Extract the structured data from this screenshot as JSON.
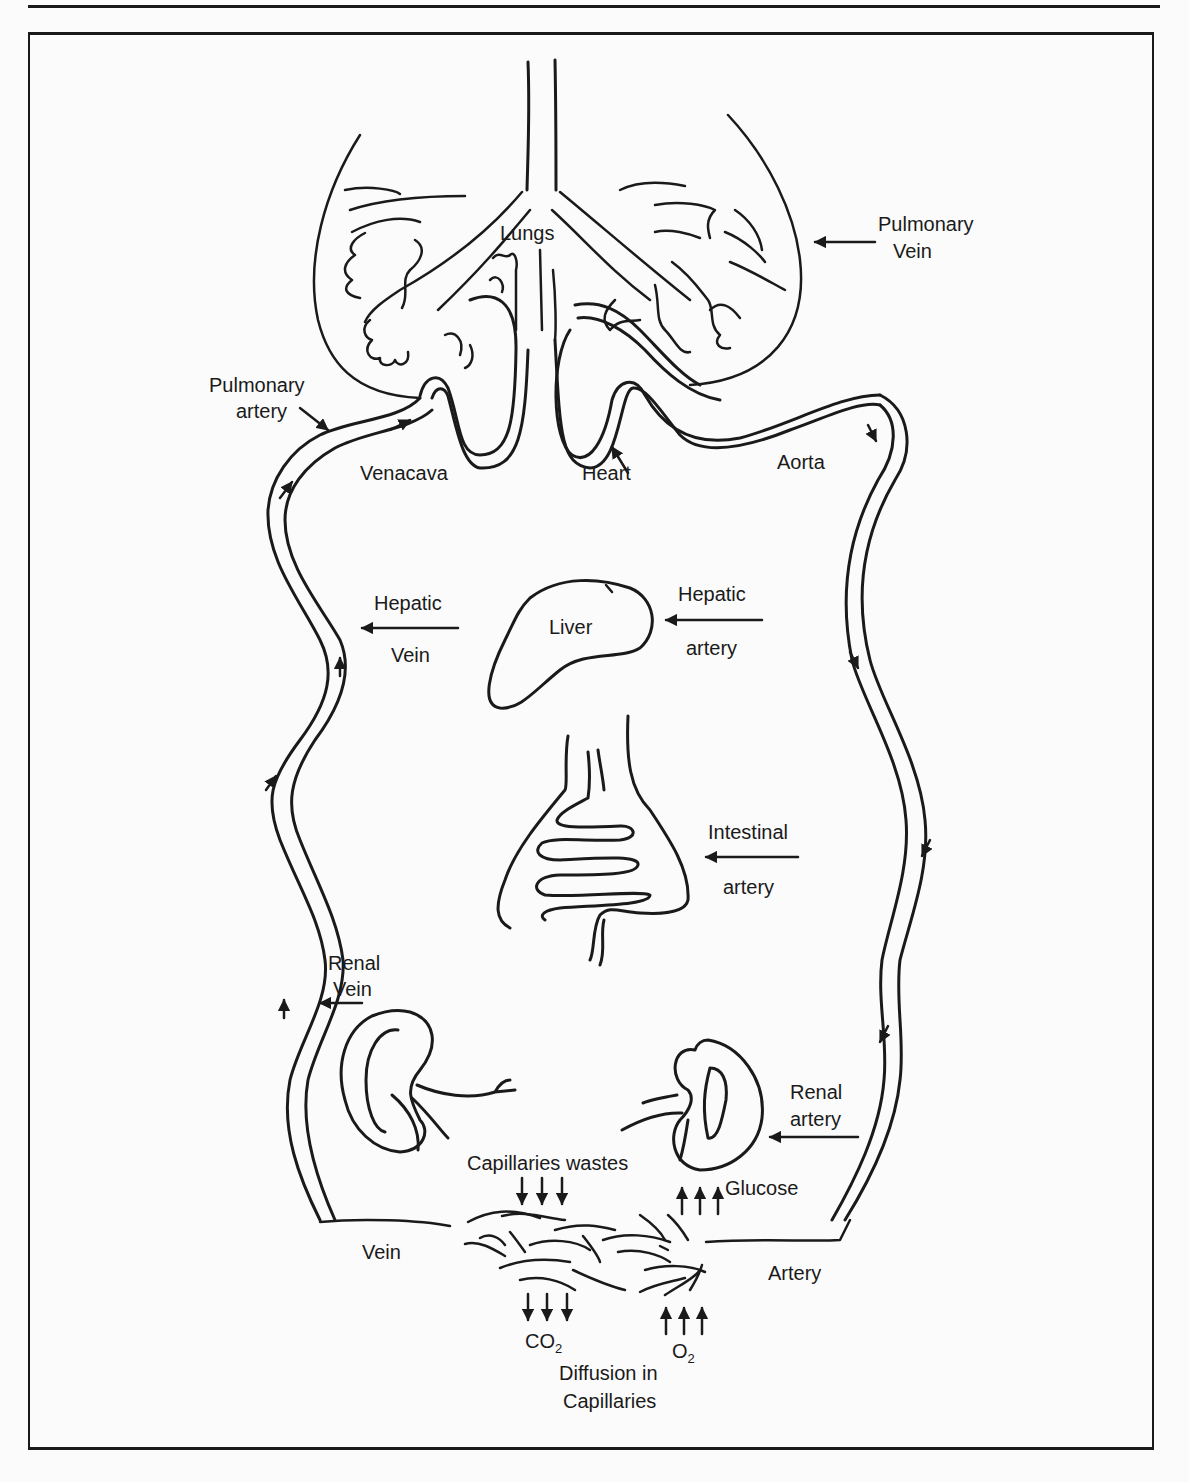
{
  "figure": {
    "colors": {
      "ink": "#1a1a1a",
      "background": "#fbfbfb"
    },
    "labels": {
      "lungs": "Lungs",
      "pulmonary_vein_1": "Pulmonary",
      "pulmonary_vein_2": "Vein",
      "pulmonary_artery_1": "Pulmonary",
      "pulmonary_artery_2": "artery",
      "venacava": "Venacava",
      "heart": "Heart",
      "aorta": "Aorta",
      "hepatic_vein_1": "Hepatic",
      "hepatic_vein_2": "Vein",
      "liver": "Liver",
      "hepatic_artery_1": "Hepatic",
      "hepatic_artery_2": "artery",
      "intestinal_artery_1": "Intestinal",
      "intestinal_artery_2": "artery",
      "renal_vein_1": "Renal",
      "renal_vein_2": "Vein",
      "renal_artery_1": "Renal",
      "renal_artery_2": "artery",
      "capillaries_wastes": "Capillaries wastes",
      "glucose": "Glucose",
      "vein": "Vein",
      "artery": "Artery",
      "co2_base": "CO",
      "co2_sub": "2",
      "o2_base": "O",
      "o2_sub": "2",
      "diffusion_1": "Diffusion in",
      "diffusion_2": "Capillaries"
    },
    "icons": {
      "flow_arrow": "arrow",
      "down_arrows": "triple-down-arrow",
      "up_arrows": "triple-up-arrow"
    }
  }
}
